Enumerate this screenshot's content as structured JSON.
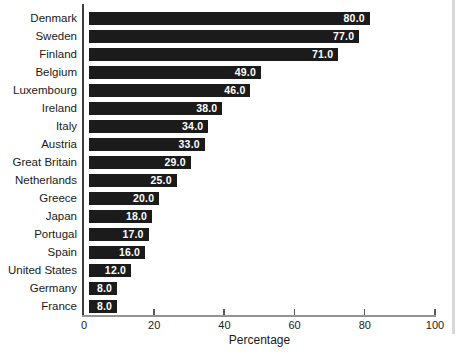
{
  "chart_data": {
    "type": "bar",
    "orientation": "horizontal",
    "categories": [
      "Denmark",
      "Sweden",
      "Finland",
      "Belgium",
      "Luxembourg",
      "Ireland",
      "Italy",
      "Austria",
      "Great Britain",
      "Netherlands",
      "Greece",
      "Japan",
      "Portugal",
      "Spain",
      "United States",
      "Germany",
      "France"
    ],
    "values": [
      80.0,
      77.0,
      71.0,
      49.0,
      46.0,
      38.0,
      34.0,
      33.0,
      29.0,
      25.0,
      20.0,
      18.0,
      17.0,
      16.0,
      12.0,
      8.0,
      8.0
    ],
    "value_labels": [
      "80.0",
      "77.0",
      "71.0",
      "49.0",
      "46.0",
      "38.0",
      "34.0",
      "33.0",
      "29.0",
      "25.0",
      "20.0",
      "18.0",
      "17.0",
      "16.0",
      "12.0",
      "8.0",
      "8.0"
    ],
    "xlabel": "Percentage",
    "xlim": [
      0,
      100
    ],
    "x_ticks": [
      0,
      20,
      40,
      60,
      80,
      100
    ],
    "grid": "off",
    "legend": "none",
    "bar_color": "#1b1b1b",
    "value_label_color": "#ffffff"
  }
}
